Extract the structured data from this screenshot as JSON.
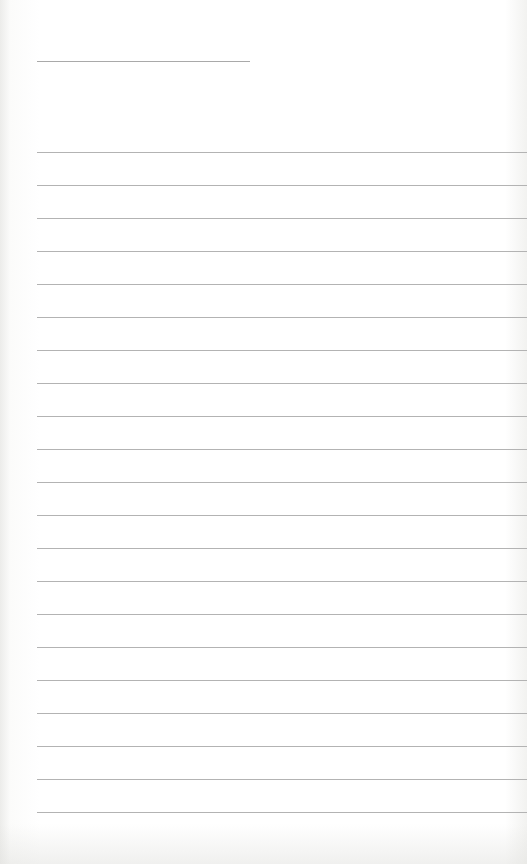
{
  "sheet": {
    "kind": "blank lined paper",
    "title_line": {
      "x": 37,
      "y": 61,
      "width": 213
    },
    "rules": {
      "count": 21,
      "start_y": 152,
      "spacing": 33,
      "left": 37
    },
    "line_color": "#b3b3b3",
    "paper_color": "#ffffff"
  }
}
